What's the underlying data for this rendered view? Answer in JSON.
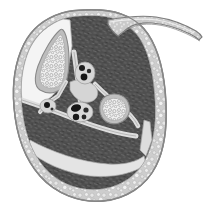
{
  "figure": {
    "modality": "grayscale medical illustration",
    "background_color": "#ffffff",
    "width": 210,
    "height": 215,
    "labels_present": false,
    "caption": ""
  },
  "palette": {
    "background": "#ffffff",
    "skin_outline": "#8d8d8d",
    "skin_line": "#6f6f6f",
    "subcutaneous_fat": "#cfcfcf",
    "fat_speckle_light": "#efefef",
    "fat_speckle_dark": "#b3b3b3",
    "muscle": "#4f4f4f",
    "muscle_texture_light": "#6e6e6e",
    "muscle_texture_dark": "#3a3a3a",
    "fascia_septum": "#d8d8d8",
    "fascia_line": "#9a9a9a",
    "bone_cortex": "#b9b9b9",
    "bone_cortex_line": "#8a8a8a",
    "bone_marrow": "#ececec",
    "trabecula": "#b0b0b0",
    "vessel_lumen": "#1d1d1d",
    "vessel_wall": "#cdcdcd",
    "intermuscular_plane": "#f2f2f2"
  },
  "structures": [
    {
      "id": "skin-envelope",
      "name": "Skin and outer contour",
      "tone": "#8d8d8d",
      "description": "Continuous oval boundary of the section"
    },
    {
      "id": "subcutaneous-fat",
      "name": "Subcutaneous fat",
      "tone": "#cfcfcf",
      "texture": "stippled lobular",
      "description": "Thick pale rim, widest inferiorly"
    },
    {
      "id": "tibia",
      "name": "Tibia",
      "tone": "#ececec",
      "texture": "trabecular",
      "position": "upper left",
      "description": "Large triangular bone with cortical rim and cancellous marrow"
    },
    {
      "id": "fibula",
      "name": "Fibula",
      "tone": "#ececec",
      "texture": "trabecular",
      "position": "centre right",
      "description": "Small triangular bone with cortical rim"
    },
    {
      "id": "bone-flange",
      "name": "Thin bone flange",
      "tone": "#c6c6c6",
      "position": "upper right",
      "description": "Tapering curved osseous strip extending beyond the section"
    },
    {
      "id": "anterior-compartment",
      "name": "Anterior muscle compartment",
      "tone": "#4f4f4f",
      "position": "upper centre"
    },
    {
      "id": "lateral-compartment",
      "name": "Lateral muscle compartment",
      "tone": "#4f4f4f",
      "position": "right"
    },
    {
      "id": "deep-posterior-compartment",
      "name": "Deep posterior compartment",
      "tone": "#4f4f4f",
      "position": "left centre"
    },
    {
      "id": "superficial-posterior-compartment",
      "name": "Superficial posterior compartment",
      "tone": "#4f4f4f",
      "position": "lower centre"
    },
    {
      "id": "fascial-septa",
      "name": "Intermuscular fascial septa",
      "tone": "#d8d8d8",
      "description": "Pale bands dividing the muscle compartments"
    }
  ],
  "neurovascular_bundles": [
    {
      "id": "bundle-anterior",
      "name": "Anterior neurovascular bundle",
      "x": 85,
      "y": 73,
      "vessel_count": 3,
      "lumen_color": "#1d1d1d"
    },
    {
      "id": "bundle-central",
      "name": "Central neurovascular bundle",
      "x": 80,
      "y": 112,
      "vessel_count": 4,
      "lumen_color": "#1d1d1d"
    },
    {
      "id": "bundle-medial",
      "name": "Medial neurovascular bundle",
      "x": 48,
      "y": 106,
      "vessel_count": 1,
      "lumen_color": "#1d1d1d"
    }
  ]
}
